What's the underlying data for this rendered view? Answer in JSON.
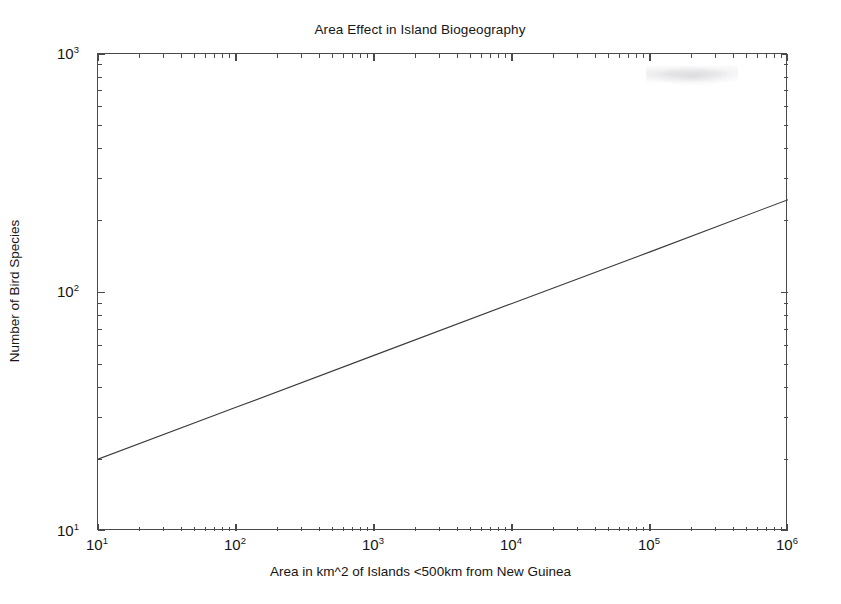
{
  "chart_data": {
    "type": "line",
    "title": "Area Effect in Island Biogeography",
    "xlabel": "Area in km^2 of Islands <500km from New Guinea",
    "ylabel": "Number of Bird Species",
    "xscale": "log",
    "yscale": "log",
    "xlim": [
      10,
      1000000
    ],
    "ylim": [
      10,
      1000
    ],
    "grid": false,
    "legend": null,
    "xticks": [
      {
        "value": 10,
        "label": "10",
        "exponent": "1"
      },
      {
        "value": 100,
        "label": "10",
        "exponent": "2"
      },
      {
        "value": 1000,
        "label": "10",
        "exponent": "3"
      },
      {
        "value": 10000,
        "label": "10",
        "exponent": "4"
      },
      {
        "value": 100000,
        "label": "10",
        "exponent": "5"
      },
      {
        "value": 1000000,
        "label": "10",
        "exponent": "6"
      }
    ],
    "yticks": [
      {
        "value": 10,
        "label": "10",
        "exponent": "1"
      },
      {
        "value": 100,
        "label": "10",
        "exponent": "2"
      },
      {
        "value": 1000,
        "label": "10",
        "exponent": "3"
      }
    ],
    "minor_ticks": true,
    "series": [
      {
        "name": "species-area relationship",
        "color": "#3c3c3c",
        "linewidth": 1.1,
        "x": [
          10,
          100,
          1000,
          10000,
          100000,
          1000000
        ],
        "y": [
          20,
          33,
          54.5,
          90,
          148,
          245
        ]
      }
    ],
    "fit": {
      "form": "S = c * A^z",
      "z": 0.218,
      "c": 12.1
    }
  }
}
